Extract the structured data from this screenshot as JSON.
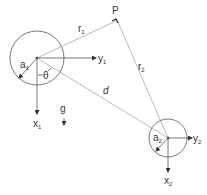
{
  "diagram": {
    "type": "two-body gravitational/geometric figure",
    "colors": {
      "line": "#555555",
      "text": "#333333",
      "background": "#ffffff"
    },
    "bodies": [
      {
        "id": "body1",
        "center": [
          37,
          58
        ],
        "radius": 27,
        "radius_label": "a",
        "radius_sub": "1",
        "x_axis_label": "x",
        "x_axis_sub": "1",
        "y_axis_label": "y",
        "y_axis_sub": "1"
      },
      {
        "id": "body2",
        "center": [
          168,
          138
        ],
        "radius": 19,
        "radius_label": "a",
        "radius_sub": "2",
        "x_axis_label": "x",
        "x_axis_sub": "2",
        "y_axis_label": "y",
        "y_axis_sub": "2"
      }
    ],
    "point": {
      "label": "P",
      "position": [
        117,
        20
      ]
    },
    "distances": {
      "r1": {
        "label": "r",
        "sub": "1"
      },
      "r2": {
        "label": "r",
        "sub": "2"
      },
      "d": {
        "label": "d"
      }
    },
    "angle": {
      "label": "θ"
    },
    "gravity": {
      "label": "g"
    }
  }
}
